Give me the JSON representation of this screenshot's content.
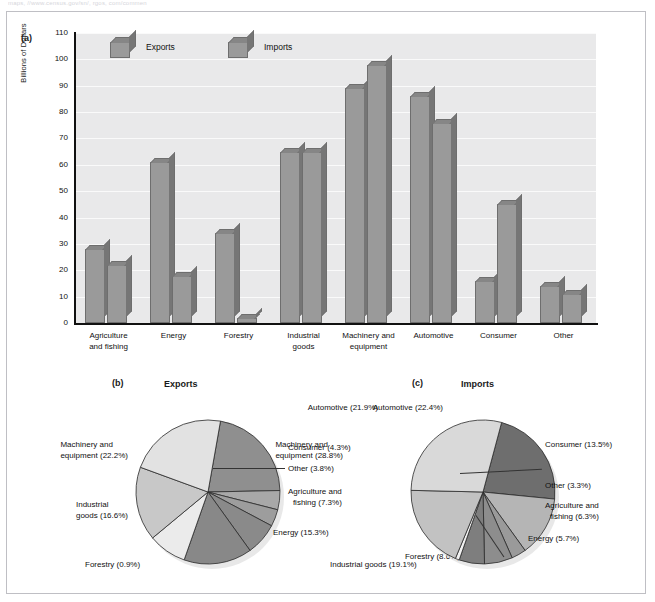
{
  "top_caption": "maps, //www.census.gov/sn/, rgos, com/commen",
  "panels": {
    "a": {
      "tag": "(a)"
    },
    "b": {
      "tag": "(b)",
      "title": "Exports"
    },
    "c": {
      "tag": "(c)",
      "title": "Imports"
    }
  },
  "chart_data": [
    {
      "type": "bar",
      "title": "",
      "xlabel": "",
      "ylabel": "Billions of Dollars",
      "ylim": [
        0,
        110
      ],
      "yticks": [
        0,
        10,
        20,
        30,
        40,
        50,
        60,
        70,
        80,
        90,
        100,
        110
      ],
      "grid": true,
      "legend_position": "top-left",
      "categories": [
        "Agriculture and fishing",
        "Energy",
        "Forestry",
        "Industrial goods",
        "Machinery and equipment",
        "Automotive",
        "Consumer",
        "Other"
      ],
      "category_lines": [
        [
          "Agriculture",
          "and fishing"
        ],
        [
          "Energy"
        ],
        [
          "Forestry"
        ],
        [
          "Industrial",
          "goods"
        ],
        [
          "Machinery and",
          "equipment"
        ],
        [
          "Automotive"
        ],
        [
          "Consumer"
        ],
        [
          "Other"
        ]
      ],
      "series": [
        {
          "name": "Exports",
          "values": [
            28,
            61,
            34,
            65,
            89,
            86,
            16,
            14
          ]
        },
        {
          "name": "Imports",
          "values": [
            22,
            18,
            2,
            65,
            98,
            76,
            45,
            11
          ]
        }
      ]
    },
    {
      "type": "pie",
      "title": "Exports",
      "labels": [
        "Automotive",
        "Consumer",
        "Other",
        "Agriculture and fishing",
        "Energy",
        "Forestry",
        "Industrial goods",
        "Machinery and equipment"
      ],
      "values": [
        21.9,
        4.3,
        3.8,
        7.3,
        15.3,
        8.6,
        16.6,
        22.2
      ],
      "label_text": [
        "Automotive (21.9%)",
        "Consumer (4.3%)",
        "Other (3.8%)",
        "Agriculture and|fishing (7.3%)",
        "Energy (15.3%)",
        "Forestry (8.6%)",
        "Industrial|goods (16.6%)",
        "Machinery and|equipment (22.2%)"
      ],
      "colors": [
        "#8f8f8f",
        "#a8a8a8",
        "#9d9d9d",
        "#8a8a8a",
        "#888888",
        "#ebebeb",
        "#c8c8c8",
        "#e2e2e2"
      ]
    },
    {
      "type": "pie",
      "title": "Imports",
      "labels": [
        "Automotive",
        "Consumer",
        "Other",
        "Agriculture and fishing",
        "Energy",
        "Forestry",
        "Industrial goods",
        "Machinery and equipment"
      ],
      "values": [
        22.4,
        13.5,
        3.3,
        6.3,
        5.7,
        0.9,
        19.1,
        28.8
      ],
      "label_text": [
        "Automotive (22.4%)",
        "Consumer (13.5%)",
        "Other (3.3%)",
        "Agriculture and|fishing (6.3%)",
        "Energy (5.7%)",
        "Forestry (0.9%)",
        "Industrial goods (19.1%)",
        "Machinery and|equipment (28.8%)"
      ],
      "colors": [
        "#6e6e6e",
        "#b5b5b5",
        "#9a9a9a",
        "#8d8d8d",
        "#7e7e7e",
        "#f2f2f2",
        "#c2c2c2",
        "#d9d9d9"
      ]
    }
  ],
  "colors": {
    "bar_face": "#9a9a9a",
    "bar_top": "#868686",
    "bar_side": "#767676",
    "plot_bg": "#e9e9ea",
    "gridline": "#fafafa",
    "axis": "#111111",
    "frame": "#bfbfc4"
  }
}
